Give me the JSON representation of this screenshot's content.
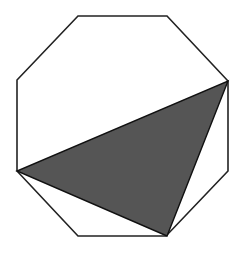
{
  "diagram": {
    "type": "geometry",
    "octagon": {
      "vertices": [
        [
          78,
          16
        ],
        [
          167,
          16
        ],
        [
          228,
          81
        ],
        [
          228,
          171
        ],
        [
          166,
          236
        ],
        [
          78,
          236
        ],
        [
          17,
          171
        ],
        [
          17,
          80
        ]
      ],
      "stroke": "#222222",
      "fill": "#ffffff"
    },
    "shaded_triangle": {
      "vertices": [
        [
          228,
          81
        ],
        [
          167,
          236
        ],
        [
          17,
          171
        ]
      ],
      "fill": "#555555",
      "stroke": "#111111"
    }
  }
}
